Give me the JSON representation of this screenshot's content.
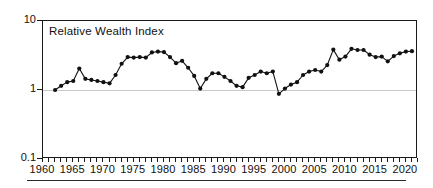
{
  "annotation": {
    "text": "Relative Wealth Index"
  },
  "chart_data": {
    "type": "line",
    "title": "",
    "annotation": "Relative Wealth Index",
    "xlabel": "",
    "ylabel": "",
    "yscale": "log",
    "ylim": [
      0.1,
      10
    ],
    "xlim": [
      1960,
      2022
    ],
    "y_tick_labels": [
      "10",
      "1",
      "0.1"
    ],
    "y_tick_values": [
      10,
      1,
      0.1
    ],
    "x_tick_labels": [
      "1960",
      "1965",
      "1970",
      "1975",
      "1980",
      "1985",
      "1990",
      "1995",
      "2000",
      "2005",
      "2010",
      "2015",
      "2020"
    ],
    "x_tick_values": [
      1960,
      1965,
      1970,
      1975,
      1980,
      1985,
      1990,
      1995,
      2000,
      2005,
      2010,
      2015,
      2020
    ],
    "x_minor_tick_step": 1,
    "grid": "horizontal-at-1",
    "legend": "none",
    "marker": "filled-circle",
    "line_color": "#111111",
    "marker_color": "#111111",
    "grid_color": "#c9c9c9",
    "axis_color": "#1a1a1a",
    "x": [
      1962,
      1963,
      1964,
      1965,
      1966,
      1967,
      1968,
      1969,
      1970,
      1971,
      1972,
      1973,
      1974,
      1975,
      1976,
      1977,
      1978,
      1979,
      1980,
      1981,
      1982,
      1983,
      1984,
      1985,
      1986,
      1987,
      1988,
      1989,
      1990,
      1991,
      1992,
      1993,
      1994,
      1995,
      1996,
      1997,
      1998,
      1999,
      2000,
      2001,
      2002,
      2003,
      2004,
      2005,
      2006,
      2007,
      2008,
      2009,
      2010,
      2011,
      2012,
      2013,
      2014,
      2015,
      2016,
      2017,
      2018,
      2019,
      2020,
      2021
    ],
    "values": [
      1.0,
      1.15,
      1.3,
      1.35,
      2.05,
      1.45,
      1.4,
      1.35,
      1.3,
      1.25,
      1.65,
      2.4,
      3.0,
      2.95,
      3.0,
      2.95,
      3.5,
      3.6,
      3.55,
      3.0,
      2.45,
      2.65,
      2.1,
      1.6,
      1.05,
      1.45,
      1.75,
      1.75,
      1.55,
      1.35,
      1.15,
      1.1,
      1.5,
      1.65,
      1.85,
      1.75,
      1.85,
      0.88,
      1.05,
      1.2,
      1.3,
      1.65,
      1.85,
      1.95,
      1.85,
      2.3,
      3.85,
      2.75,
      3.05,
      3.95,
      3.8,
      3.8,
      3.25,
      3.0,
      3.05,
      2.6,
      3.1,
      3.4,
      3.6,
      3.65
    ],
    "series": [
      {
        "name": "Relative Wealth Index",
        "values": [
          1.0,
          1.15,
          1.3,
          1.35,
          2.05,
          1.45,
          1.4,
          1.35,
          1.3,
          1.25,
          1.65,
          2.4,
          3.0,
          2.95,
          3.0,
          2.95,
          3.5,
          3.6,
          3.55,
          3.0,
          2.45,
          2.65,
          2.1,
          1.6,
          1.05,
          1.45,
          1.75,
          1.75,
          1.55,
          1.35,
          1.15,
          1.1,
          1.5,
          1.65,
          1.85,
          1.75,
          1.85,
          0.88,
          1.05,
          1.2,
          1.3,
          1.65,
          1.85,
          1.95,
          1.85,
          2.3,
          3.85,
          2.75,
          3.05,
          3.95,
          3.8,
          3.8,
          3.25,
          3.0,
          3.05,
          2.6,
          3.1,
          3.4,
          3.6,
          3.65
        ]
      }
    ]
  }
}
